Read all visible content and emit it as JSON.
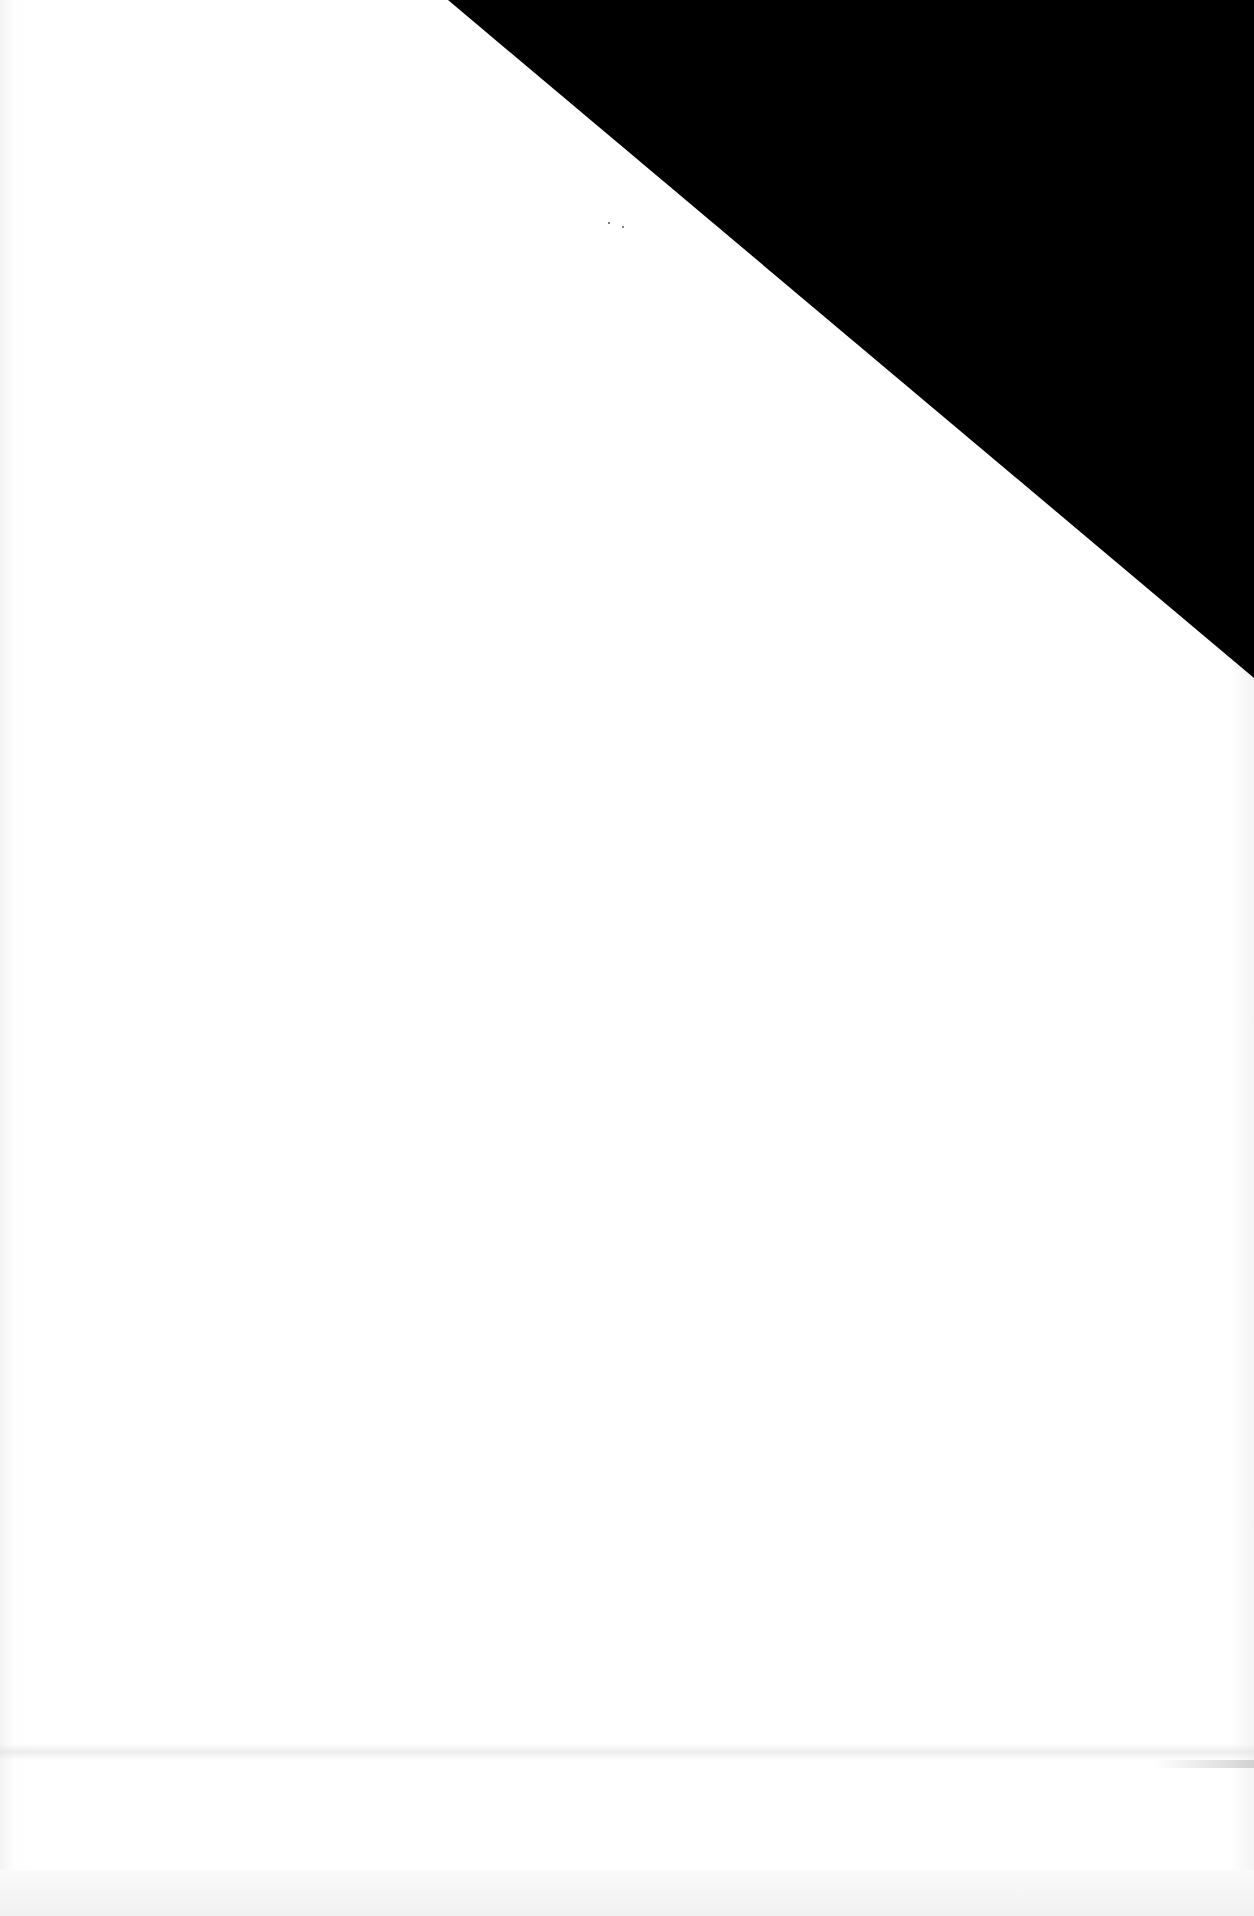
{
  "page": {
    "type": "scanned blank page",
    "background_color": "#ffffff",
    "fold_corner": {
      "color": "#000000",
      "points": [
        [
          448,
          0
        ],
        [
          1254,
          0
        ],
        [
          1254,
          678
        ]
      ]
    },
    "text_content": []
  }
}
